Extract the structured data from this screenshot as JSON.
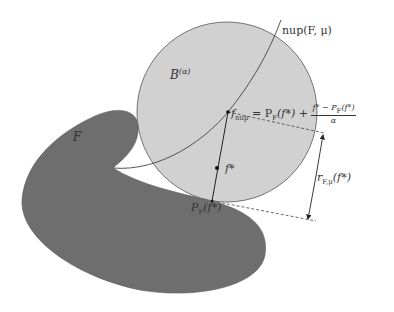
{
  "diagram": {
    "colors": {
      "set_fill": "#6e6e6e",
      "ball_fill": "#cfcfcf",
      "ball_stroke": "#555555",
      "curve_stroke": "#444444",
      "text": "#333333",
      "background": "#ffffff"
    },
    "labels": {
      "set": "F",
      "ball": "B",
      "ball_sup": "(α)",
      "curve": "nup(F, μ)",
      "f_nup_lhs": "f",
      "f_nup_sub": "nup",
      "f_nup_eq": " = P",
      "f_nup_eq_sub": "F",
      "f_nup_eq_rest": "(f*) + ",
      "frac_num": "f* − P",
      "frac_num_sub": "F",
      "frac_num_rest": "(f*)",
      "frac_den": "α",
      "f_star": "f*",
      "proj": "P",
      "proj_sub": "F",
      "proj_rest": "(f*)",
      "radius": "r",
      "radius_sub": "F,μ",
      "radius_rest": "(f*)"
    }
  }
}
